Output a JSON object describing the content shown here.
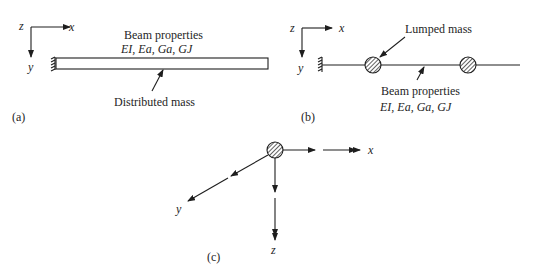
{
  "diagram": {
    "panel_a": {
      "caption": "(a)",
      "axes": {
        "x": "x",
        "y": "y",
        "z": "z"
      },
      "beam_label": "Beam properties",
      "beam_props": "EI, Ea, Ga, GJ",
      "mass_label": "Distributed mass"
    },
    "panel_b": {
      "caption": "(b)",
      "axes": {
        "x": "x",
        "y": "y",
        "z": "z"
      },
      "mass_label": "Lumped mass",
      "beam_label": "Beam properties",
      "beam_props": "EI, Ea, Ga, GJ"
    },
    "panel_c": {
      "caption": "(c)",
      "axes": {
        "x": "x",
        "y": "y",
        "z": "z"
      }
    },
    "colors": {
      "ink": "#1e1e1e",
      "background": "#ffffff"
    }
  }
}
